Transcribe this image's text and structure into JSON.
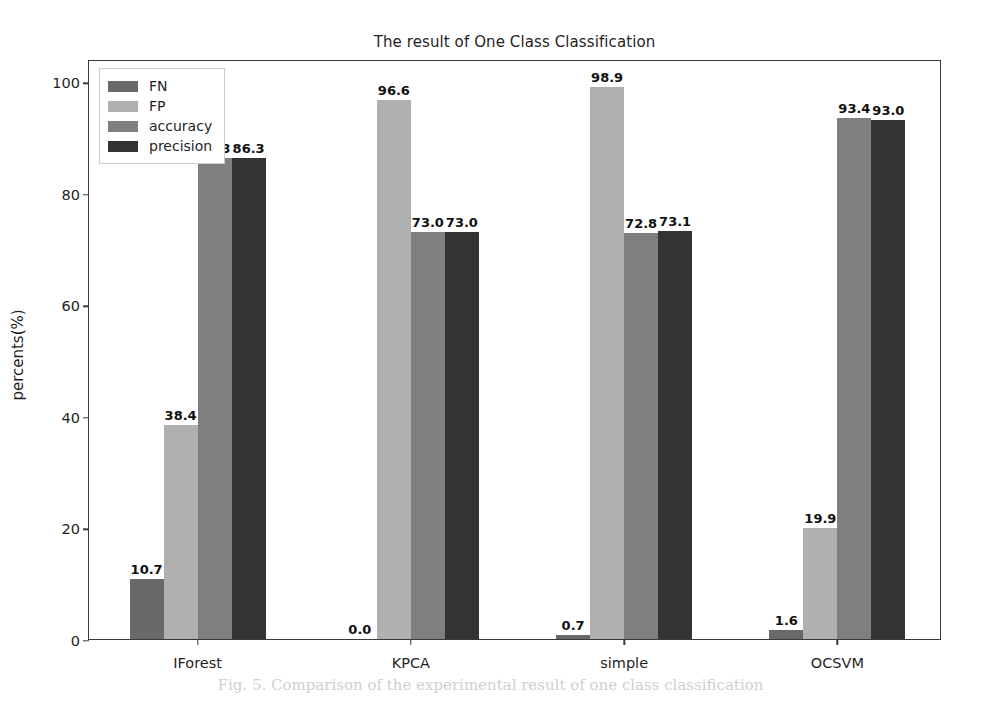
{
  "chart_data": {
    "type": "bar",
    "title": "The result of One Class Classification",
    "xlabel": "",
    "ylabel": "percents(%)",
    "categories": [
      "IForest",
      "KPCA",
      "simple",
      "OCSVM"
    ],
    "series": [
      {
        "name": "FN",
        "color": "#696969",
        "values": [
          10.7,
          0.0,
          0.7,
          1.6
        ]
      },
      {
        "name": "FP",
        "color": "#b0b0b0",
        "values": [
          38.4,
          96.6,
          98.9,
          19.9
        ]
      },
      {
        "name": "accuracy",
        "color": "#7f7f7f",
        "values": [
          86.3,
          73.0,
          72.8,
          93.4
        ]
      },
      {
        "name": "precision",
        "color": "#333333",
        "values": [
          86.3,
          73.0,
          73.1,
          93.0
        ]
      }
    ],
    "value_labels": [
      [
        "10.7",
        "38.4",
        "86.3",
        "86.3"
      ],
      [
        "0.0",
        "96.6",
        "73.0",
        "73.0"
      ],
      [
        "0.7",
        "98.9",
        "72.8",
        "73.1"
      ],
      [
        "1.6",
        "19.9",
        "93.4",
        "93.0"
      ]
    ],
    "yticks": [
      0,
      20,
      40,
      60,
      80,
      100
    ],
    "ytick_labels": [
      "0",
      "20",
      "40",
      "60",
      "80",
      "100"
    ],
    "ylim": [
      0,
      104
    ],
    "grid": false,
    "legend_position": "upper-left",
    "legend_entries": [
      "FN",
      "FP",
      "accuracy",
      "precision"
    ]
  },
  "caption": "Fig. 5.  Comparison of the experimental result of one class classification"
}
